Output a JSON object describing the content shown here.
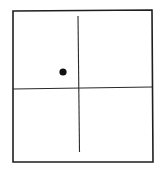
{
  "diagram": {
    "type": "quadrant-grid",
    "width": 163,
    "height": 170,
    "colors": {
      "background": "#ffffff",
      "stroke": "#1e1e1e",
      "inner_stroke": "#2a2a2a",
      "dot": "#111111"
    },
    "frame": {
      "top_left": [
        13,
        11
      ],
      "top_right": [
        152,
        10
      ],
      "bottom_right": [
        153,
        162
      ],
      "bottom_left": [
        13,
        162
      ],
      "stroke_width": 1.6
    },
    "vertical_axis": {
      "x1": 78,
      "y1": 16,
      "x2": 79.5,
      "y2": 152,
      "stroke_width": 1.1
    },
    "horizontal_axis": {
      "x1": 13,
      "y1": 89,
      "x2": 152,
      "y2": 87,
      "stroke_width": 1.1
    },
    "point": {
      "cx": 63,
      "cy": 72,
      "r": 3.6,
      "quadrant": "upper-left"
    }
  }
}
